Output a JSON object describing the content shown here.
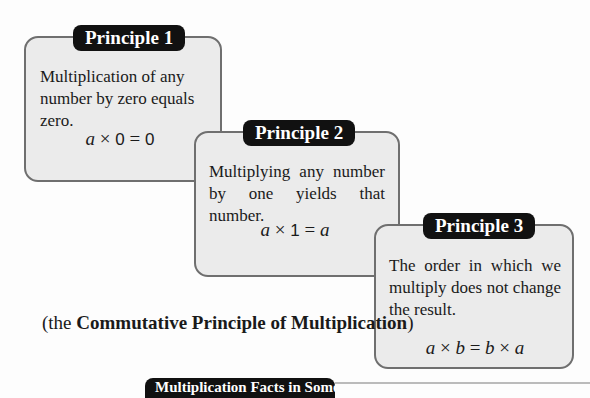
{
  "principles": [
    {
      "label": "Principle 1",
      "text": "Multiplication of any number by zero equals zero.",
      "formula": {
        "lhs_var": "a",
        "op": "×",
        "num": "0",
        "eq": "=",
        "rhs": "0"
      }
    },
    {
      "label": "Principle 2",
      "text": "Multiplying any number by one yields that number.",
      "formula": {
        "lhs_var": "a",
        "op": "×",
        "num": "1",
        "eq": "=",
        "rhs": "a"
      }
    },
    {
      "label": "Principle 3",
      "text": "The order in which we multiply does not change the result.",
      "formula": {
        "a": "a",
        "op1": "×",
        "b": "b",
        "eq": "=",
        "b2": "b",
        "op2": "×",
        "a2": "a"
      }
    }
  ],
  "caption": {
    "open": "(the ",
    "bold": "Commutative Principle of Multiplication",
    "close": ")"
  },
  "bottom_label": "Multiplication Facts in Some Bases"
}
